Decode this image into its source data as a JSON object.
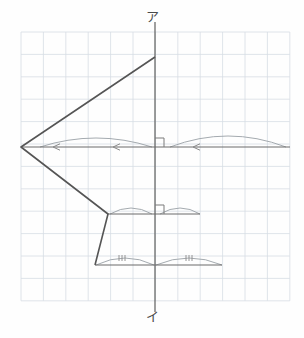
{
  "figure": {
    "title_visible": false,
    "background_color": "#fefefe",
    "grid": {
      "color": "#d7dde4",
      "line_width": 0.8,
      "cell_size_px": 22.4,
      "x_start_px": 21,
      "y_start_px": 32,
      "cols": 12,
      "rows": 12,
      "outer_border": true
    },
    "axes": {
      "color": "#6b6b6b",
      "vertical_axis": {
        "x_px": 155,
        "y_top_px": 22,
        "y_bottom_px": 312,
        "top_label": "ア",
        "bottom_label": "イ"
      },
      "horizontal_axis": {
        "y_px": 147,
        "x_left_px": 21,
        "x_right_px": 290,
        "arrowheads": [
          "left",
          "left",
          "left"
        ]
      }
    },
    "polygon": {
      "stroke_color": "#555555",
      "stroke_width": 1.6,
      "vertices_px": [
        {
          "x": 155,
          "y": 57,
          "name": "top-vertex"
        },
        {
          "x": 21,
          "y": 147,
          "name": "left-apex"
        },
        {
          "x": 108,
          "y": 214,
          "name": "mid-right-vertex"
        },
        {
          "x": 95,
          "y": 265,
          "name": "lower-left-vertex"
        }
      ]
    },
    "horizontal_segments": [
      {
        "name": "upper-segment",
        "y_px": 147,
        "x1_px": 21,
        "x2_px": 290
      },
      {
        "name": "middle-segment",
        "y_px": 214,
        "x1_px": 108,
        "x2_px": 200
      },
      {
        "name": "lower-segment",
        "y_px": 265,
        "x1_px": 95,
        "x2_px": 222
      }
    ],
    "right_angle_marks": [
      {
        "name": "upper-right-angle",
        "x_px": 155,
        "y_px": 147,
        "size_px": 9
      },
      {
        "name": "middle-right-angle",
        "x_px": 155,
        "y_px": 214,
        "size_px": 9
      }
    ],
    "arcs": [
      {
        "name": "upper-left-arc",
        "x1_px": 40,
        "x2_px": 152,
        "y_px": 147,
        "rise_px": 9,
        "ticks": 0
      },
      {
        "name": "upper-right-arc",
        "x1_px": 170,
        "x2_px": 286,
        "y_px": 147,
        "rise_px": 11,
        "ticks": 0
      },
      {
        "name": "middle-left-arc",
        "x1_px": 110,
        "x2_px": 152,
        "y_px": 214,
        "rise_px": 6,
        "ticks": 0
      },
      {
        "name": "middle-right-arc",
        "x1_px": 160,
        "x2_px": 200,
        "y_px": 214,
        "rise_px": 6,
        "ticks": 0
      },
      {
        "name": "lower-left-arc",
        "x1_px": 96,
        "x2_px": 154,
        "y_px": 265,
        "rise_px": 7,
        "ticks": 3
      },
      {
        "name": "lower-right-arc",
        "x1_px": 156,
        "x2_px": 222,
        "y_px": 265,
        "rise_px": 7,
        "ticks": 3
      }
    ],
    "tick_marks": {
      "color": "#8a8a8a",
      "groups": [
        {
          "name": "lower-left-tick-group",
          "x_px": 119,
          "y_px": 258,
          "count": 3
        },
        {
          "name": "lower-right-tick-group",
          "x_px": 186,
          "y_px": 258,
          "count": 3
        }
      ]
    },
    "labels": {
      "top": "ア",
      "bottom": "イ"
    }
  }
}
